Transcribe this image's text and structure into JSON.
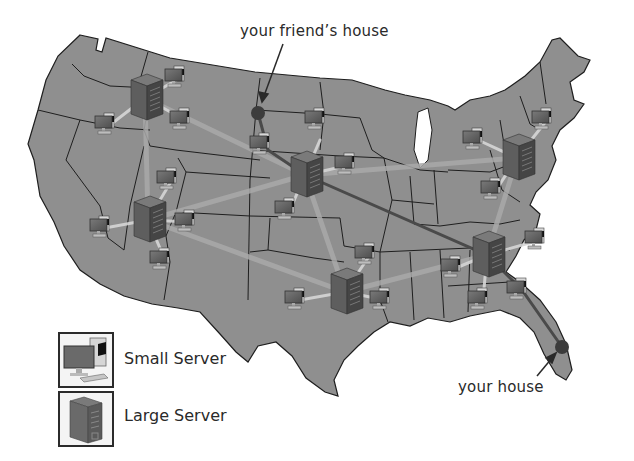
{
  "diagram": {
    "labels": {
      "friend": "your friend’s house",
      "house": "your house"
    },
    "legend": {
      "items": [
        {
          "icon": "small-server-icon",
          "label": "Small Server"
        },
        {
          "icon": "large-server-icon",
          "label": "Large Server"
        }
      ]
    },
    "colors": {
      "land": "#8f8f8f",
      "border": "#1e1e1e",
      "background": "#ffffff",
      "route": "#4a4a4a",
      "backbone": "#a9a9a9",
      "endpoint": "#3c3c3c",
      "text": "#2a2a2a"
    },
    "large_servers": [
      {
        "id": "nw",
        "x": 145,
        "y": 98
      },
      {
        "id": "sw",
        "x": 148,
        "y": 220
      },
      {
        "id": "central",
        "x": 305,
        "y": 175
      },
      {
        "id": "south",
        "x": 345,
        "y": 292
      },
      {
        "id": "ne",
        "x": 517,
        "y": 158
      },
      {
        "id": "se",
        "x": 487,
        "y": 255
      }
    ],
    "small_servers": [
      {
        "x": 180,
        "y": 78
      },
      {
        "x": 110,
        "y": 125
      },
      {
        "x": 185,
        "y": 120
      },
      {
        "x": 172,
        "y": 180
      },
      {
        "x": 105,
        "y": 228
      },
      {
        "x": 190,
        "y": 222
      },
      {
        "x": 165,
        "y": 260
      },
      {
        "x": 265,
        "y": 145
      },
      {
        "x": 350,
        "y": 165
      },
      {
        "x": 290,
        "y": 210
      },
      {
        "x": 370,
        "y": 255
      },
      {
        "x": 300,
        "y": 300
      },
      {
        "x": 385,
        "y": 300
      },
      {
        "x": 478,
        "y": 140
      },
      {
        "x": 547,
        "y": 120
      },
      {
        "x": 496,
        "y": 190
      },
      {
        "x": 540,
        "y": 240
      },
      {
        "x": 456,
        "y": 268
      },
      {
        "x": 483,
        "y": 300
      },
      {
        "x": 522,
        "y": 290
      }
    ],
    "endpoints": {
      "friend": {
        "x": 258,
        "y": 113
      },
      "house": {
        "x": 562,
        "y": 347
      }
    }
  }
}
